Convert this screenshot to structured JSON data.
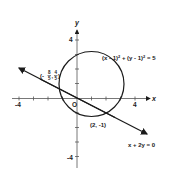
{
  "diagram": {
    "axes": {
      "x_label": "x",
      "y_label": "y",
      "origin_label": "O",
      "x_ticks": {
        "neg": "-4",
        "pos": "4"
      },
      "y_ticks": {
        "pos": "4",
        "neg": "-4"
      },
      "range": [
        -4,
        4
      ]
    },
    "circle": {
      "equation": "(x - 1)² + (y - 1)² = 5",
      "eq_part1": "(x - 1)",
      "eq_part2": " + (y - 1)",
      "eq_part3": " = 5",
      "sup": "2",
      "center": [
        1,
        1
      ],
      "radius_squared": 5
    },
    "line": {
      "equation": "x + 2y = 0"
    },
    "intersections": [
      {
        "label": "(-8/5, 4/5)",
        "paren_open": "(-",
        "num1": "8",
        "den1": "5",
        "comma": ",",
        "num2": "4",
        "den2": "5",
        "paren_close": ")",
        "point": [
          -1.6,
          0.8
        ]
      },
      {
        "label": "(2, -1)",
        "point": [
          2,
          -1
        ]
      }
    ],
    "colors": {
      "ink": "#1a1a1a",
      "background": "#ffffff"
    }
  }
}
